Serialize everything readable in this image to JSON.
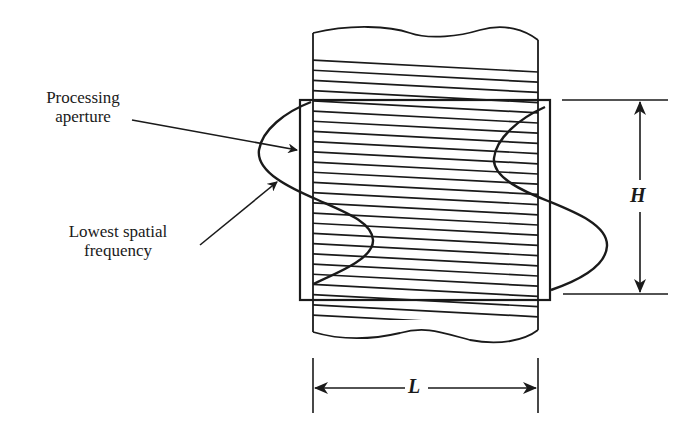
{
  "labels": {
    "processing_aperture": [
      "Processing",
      "aperture"
    ],
    "lowest_spatial_frequency": [
      "Lowest spatial",
      "frequency"
    ]
  },
  "dimensions": {
    "height": "H",
    "length": "L"
  },
  "geometry": {
    "film_strip": {
      "x0": 312,
      "x1": 538,
      "top": 33,
      "bottom": 336
    },
    "aperture": {
      "x0": 300,
      "y0": 100,
      "x1": 550,
      "y1": 300
    },
    "hatch": {
      "start_y": 60,
      "end_y": 318,
      "spacing": 10.2,
      "slope_drop": 12
    },
    "line_color": "#1a1a1a"
  }
}
